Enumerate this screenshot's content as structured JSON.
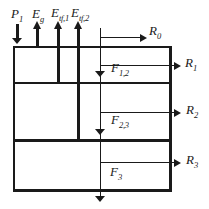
{
  "colors": {
    "line": "#1a1a1a",
    "background": "#ffffff"
  },
  "labels": {
    "precipitation": {
      "base": "P",
      "sub": "1"
    },
    "soil_evaporation": {
      "base": "E",
      "sub": "g"
    },
    "transpiration_1": {
      "base": "E",
      "sub": "tf,1"
    },
    "transpiration_2": {
      "base": "E",
      "sub": "tf,2"
    },
    "surface_runoff": {
      "base": "R",
      "sub": "0"
    },
    "runoff_layer_1": {
      "base": "R",
      "sub": "1"
    },
    "runoff_layer_2": {
      "base": "R",
      "sub": "2"
    },
    "runoff_layer_3": {
      "base": "R",
      "sub": "3"
    },
    "flow_1_to_2": {
      "base": "F",
      "sub": "1,2"
    },
    "flow_2_to_3": {
      "base": "F",
      "sub": "2,3"
    },
    "deep_flow": {
      "base": "F",
      "sub": "3"
    }
  }
}
